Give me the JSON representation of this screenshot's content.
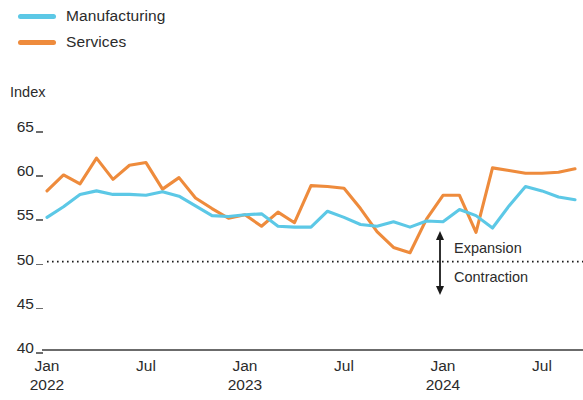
{
  "legend": {
    "position": "top-left",
    "items": [
      {
        "label": "Manufacturing",
        "color": "#5CC8E6",
        "icon": "line-swatch-icon"
      },
      {
        "label": "Services",
        "color": "#EE8B3C",
        "icon": "line-swatch-icon"
      }
    ]
  },
  "axis": {
    "y_unit_label": "Index",
    "y_ticks": [
      "65",
      "60",
      "55",
      "50",
      "45",
      "40"
    ],
    "x_ticks": [
      {
        "month": "Jan",
        "year": "2022"
      },
      {
        "month": "Jul",
        "year": ""
      },
      {
        "month": "Jan",
        "year": "2023"
      },
      {
        "month": "Jul",
        "year": ""
      },
      {
        "month": "Jan",
        "year": "2024"
      },
      {
        "month": "Jul",
        "year": ""
      }
    ]
  },
  "annotations": {
    "expansion": "Expansion",
    "contraction": "Contraction",
    "threshold_value": "50"
  },
  "chart_data": {
    "type": "line",
    "title": "",
    "subtitle": "",
    "xlabel": "",
    "ylabel": "Index",
    "ylim": [
      40,
      65
    ],
    "yticks": [
      40,
      45,
      50,
      55,
      60,
      65
    ],
    "grid": false,
    "legend_position": "top-left",
    "threshold_line": {
      "value": 50,
      "style": "dotted",
      "color": "#1a1a1a"
    },
    "annotations": [
      {
        "text": "Expansion",
        "x": "2024-02",
        "y": 53.5,
        "arrow": "up"
      },
      {
        "text": "Contraction",
        "x": "2024-02",
        "y": 47.0,
        "arrow": "down"
      }
    ],
    "x": [
      "2022-01",
      "2022-02",
      "2022-03",
      "2022-04",
      "2022-05",
      "2022-06",
      "2022-07",
      "2022-08",
      "2022-09",
      "2022-10",
      "2022-11",
      "2022-12",
      "2023-01",
      "2023-02",
      "2023-03",
      "2023-04",
      "2023-05",
      "2023-06",
      "2023-07",
      "2023-08",
      "2023-09",
      "2023-10",
      "2023-11",
      "2023-12",
      "2024-01",
      "2024-02",
      "2024-03",
      "2024-04",
      "2024-05",
      "2024-06",
      "2024-07",
      "2024-08",
      "2024-09"
    ],
    "categories": [
      "Jan 2022",
      "Feb 2022",
      "Mar 2022",
      "Apr 2022",
      "May 2022",
      "Jun 2022",
      "Jul 2022",
      "Aug 2022",
      "Sep 2022",
      "Oct 2022",
      "Nov 2022",
      "Dec 2022",
      "Jan 2023",
      "Feb 2023",
      "Mar 2023",
      "Apr 2023",
      "May 2023",
      "Jun 2023",
      "Jul 2023",
      "Aug 2023",
      "Sep 2023",
      "Oct 2023",
      "Nov 2023",
      "Dec 2023",
      "Jan 2024",
      "Feb 2024",
      "Mar 2024",
      "Apr 2024",
      "May 2024",
      "Jun 2024",
      "Jul 2024",
      "Aug 2024",
      "Sep 2024"
    ],
    "series": [
      {
        "name": "Manufacturing",
        "color": "#5CC8E6",
        "values": [
          55.0,
          56.2,
          57.6,
          58.0,
          57.6,
          57.6,
          57.5,
          57.9,
          57.4,
          56.3,
          55.2,
          55.1,
          55.3,
          55.4,
          54.0,
          53.9,
          53.9,
          55.7,
          55.0,
          54.2,
          54.0,
          54.5,
          53.9,
          54.6,
          54.5,
          55.9,
          55.2,
          53.8,
          56.3,
          58.5,
          58.0,
          57.3,
          57.0
        ]
      },
      {
        "name": "Services",
        "color": "#EE8B3C",
        "values": [
          58.0,
          59.8,
          58.8,
          61.7,
          59.3,
          60.9,
          61.2,
          58.2,
          59.5,
          57.2,
          56.0,
          54.9,
          55.3,
          54.0,
          55.6,
          54.4,
          58.6,
          58.5,
          58.3,
          56.0,
          53.4,
          51.6,
          51.0,
          54.8,
          57.5,
          57.5,
          53.3,
          60.6,
          60.3,
          60.0,
          60.0,
          60.1,
          60.5
        ]
      }
    ]
  }
}
